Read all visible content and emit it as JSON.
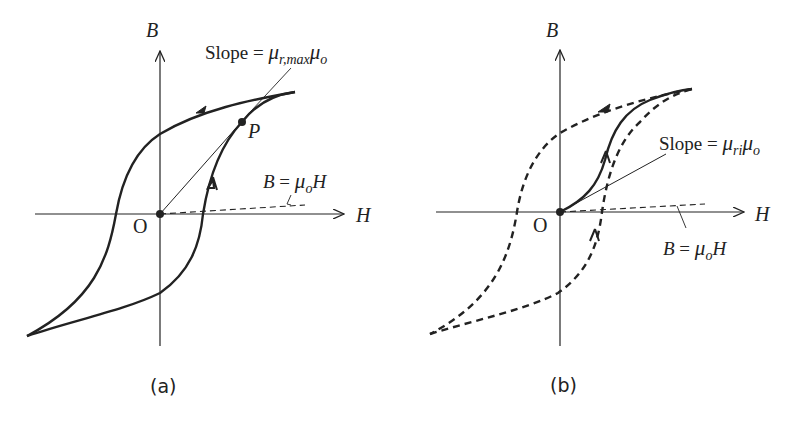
{
  "figure": {
    "panels": [
      {
        "id": "a",
        "caption": "(a)",
        "axes": {
          "x_label": "H",
          "y_label": "B",
          "origin_label": "O"
        },
        "annotations": {
          "slope_label_prefix": "Slope = ",
          "slope_mu": "μ",
          "slope_sub": "r,max",
          "slope_mu2": "μ",
          "slope_sub2": "o",
          "point_label": "P",
          "vacuum_line_B": "B",
          "vacuum_line_eq": " = ",
          "vacuum_line_mu": "μ",
          "vacuum_line_sub": "o",
          "vacuum_line_H": "H"
        },
        "curves": [
          {
            "name": "hysteresis-loop",
            "style": "solid"
          },
          {
            "name": "max-slope-line",
            "style": "solid-thin",
            "from": "O",
            "to": "P"
          },
          {
            "name": "vacuum-line",
            "style": "dashed",
            "equation": "B = μoH"
          }
        ]
      },
      {
        "id": "b",
        "caption": "(b)",
        "axes": {
          "x_label": "H",
          "y_label": "B",
          "origin_label": "O"
        },
        "annotations": {
          "slope_label_prefix": "Slope = ",
          "slope_mu": "μ",
          "slope_sub": "ri",
          "slope_mu2": "μ",
          "slope_sub2": "o",
          "vacuum_line_B": "B",
          "vacuum_line_eq": " = ",
          "vacuum_line_mu": "μ",
          "vacuum_line_sub": "o",
          "vacuum_line_H": "H"
        },
        "curves": [
          {
            "name": "hysteresis-loop",
            "style": "dashed"
          },
          {
            "name": "initial-magnetization-curve",
            "style": "solid"
          },
          {
            "name": "vacuum-line",
            "style": "dashed",
            "equation": "B = μoH"
          }
        ]
      }
    ]
  }
}
